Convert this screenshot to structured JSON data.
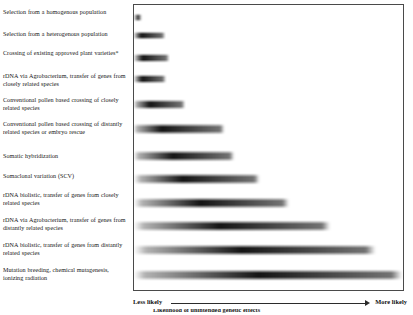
{
  "figure": {
    "frame_border_color": "#4a4a4a",
    "bar_color": "#000000",
    "background": "#ffffff"
  },
  "axis": {
    "left_label": "Less likely",
    "right_label": "More likely",
    "arrow_direction": "right",
    "caption_clipped": "Likelihood of unintended genetic effects"
  },
  "rows": [
    {
      "label": "Selection from a homogenous population",
      "label_top": 8,
      "bar_top": 12,
      "bar_height": 9,
      "bar_width": 12,
      "peak": 0.38,
      "left_fade": 0.12,
      "right_fade": 0.55
    },
    {
      "label": "Selection from a heterogenous population",
      "label_top": 30,
      "bar_top": 30,
      "bar_height": 9,
      "bar_width": 32,
      "peak": 0.22,
      "left_fade": 0.04,
      "right_fade": 0.95
    },
    {
      "label": "Crossing of existing approved plant varieties*",
      "label_top": 49,
      "bar_top": 52,
      "bar_height": 10,
      "bar_width": 36,
      "peak": 0.24,
      "left_fade": 0.05,
      "right_fade": 0.96
    },
    {
      "label": "rDNA via Agrobacterium, transfer of genes from closely related species",
      "label_top": 72,
      "bar_top": 73,
      "bar_height": 10,
      "bar_width": 33,
      "peak": 0.24,
      "left_fade": 0.05,
      "right_fade": 0.94
    },
    {
      "label": "Conventional pollen based crossing of closely related species",
      "label_top": 96,
      "bar_top": 98,
      "bar_height": 11,
      "bar_width": 52,
      "peak": 0.3,
      "left_fade": 0.04,
      "right_fade": 0.97
    },
    {
      "label": "Conventional pollen based crossing of distantly related species or embryo rescue",
      "label_top": 120,
      "bar_top": 122,
      "bar_height": 12,
      "bar_width": 92,
      "peak": 0.3,
      "left_fade": 0.03,
      "right_fade": 0.98
    },
    {
      "label": "Somatic hybridization",
      "label_top": 152,
      "bar_top": 149,
      "bar_height": 12,
      "bar_width": 102,
      "peak": 0.38,
      "left_fade": 0.04,
      "right_fade": 0.98
    },
    {
      "label": "Somaclonal variation (SCV)",
      "label_top": 172,
      "bar_top": 172,
      "bar_height": 12,
      "bar_width": 128,
      "peak": 0.38,
      "left_fade": 0.05,
      "right_fade": 0.98
    },
    {
      "label": "rDNA biolistic, transfer of genes from closely related species",
      "label_top": 191,
      "bar_top": 196,
      "bar_height": 12,
      "bar_width": 158,
      "peak": 0.42,
      "left_fade": 0.05,
      "right_fade": 0.98
    },
    {
      "label": "rDNA via Agrobacterium, transfer of genes from distantly related species",
      "label_top": 216,
      "bar_top": 219,
      "bar_height": 12,
      "bar_width": 200,
      "peak": 0.43,
      "left_fade": 0.05,
      "right_fade": 0.98
    },
    {
      "label": "rDNA biolistic, transfer of genes from distantly related species",
      "label_top": 241,
      "bar_top": 243,
      "bar_height": 12,
      "bar_width": 244,
      "peak": 0.44,
      "left_fade": 0.05,
      "right_fade": 0.99
    },
    {
      "label": "Mutation breeding, chemical mutagenesis, ionizing radiation",
      "label_top": 266,
      "bar_top": 268,
      "bar_height": 12,
      "bar_width": 271,
      "peak": 0.46,
      "left_fade": 0.04,
      "right_fade": 0.99
    }
  ],
  "chart_data": {
    "type": "heatmap",
    "xlabel": "Likelihood of unintended effects",
    "ylabel": "",
    "x_axis_left_anchor": "Less likely",
    "x_axis_right_anchor": "More likely",
    "grid": false,
    "legend": "none",
    "encoding": "Each row is a horizontal gradient band; band length and darkness indicate the relative range and likelihood of unintended genetic effects for that technique. Bands are ordered from least likely (top) to most likely (bottom).",
    "categories": [
      "Selection from a homogenous population",
      "Selection from a heterogenous population",
      "Crossing of existing approved plant varieties*",
      "rDNA via Agrobacterium, transfer of genes from closely related species",
      "Conventional pollen based crossing of closely related species",
      "Conventional pollen based crossing of distantly related species or embryo rescue",
      "Somatic hybridization",
      "Somaclonal variation (SCV)",
      "rDNA biolistic, transfer of genes from closely related species",
      "rDNA via Agrobacterium, transfer of genes from distantly related species",
      "rDNA biolistic, transfer of genes from distantly related species",
      "Mutation breeding, chemical mutagenesis, ionizing radiation"
    ],
    "values": [
      4,
      12,
      13,
      12,
      19,
      34,
      38,
      47,
      58,
      74,
      90,
      100
    ],
    "value_unit": "relative band extent (% of axis width)",
    "xlim": [
      0,
      100
    ]
  }
}
